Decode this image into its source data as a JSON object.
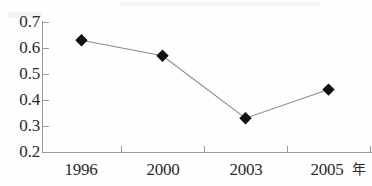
{
  "chart_data": {
    "type": "line",
    "title": "",
    "subtitle": "",
    "xlabel": "年",
    "ylabel": "",
    "categories": [
      "1996",
      "2000",
      "2003",
      "2005"
    ],
    "x": [
      1996,
      2000,
      2003,
      2005
    ],
    "values": [
      0.63,
      0.57,
      0.33,
      0.44
    ],
    "series": [
      {
        "name": "",
        "values": [
          0.63,
          0.57,
          0.33,
          0.44
        ]
      }
    ],
    "ylim": [
      0.2,
      0.7
    ],
    "ytick_labels": [
      "0.7",
      "0.6",
      "0.5",
      "0.4",
      "0.3",
      "0.2"
    ],
    "ytick_values": [
      0.7,
      0.6,
      0.5,
      0.4,
      0.3,
      0.2
    ],
    "xtick_labels": [
      "1996",
      "2000",
      "2003",
      "2005"
    ],
    "grid": false,
    "legend": "none",
    "marker": "diamond",
    "marker_color": "#111111",
    "line_color": "#8c8c8c",
    "axis_color": "#9a9a9a",
    "text_color": "#2b2b2b",
    "annotations": []
  },
  "axis": {
    "unit_label": "年"
  }
}
